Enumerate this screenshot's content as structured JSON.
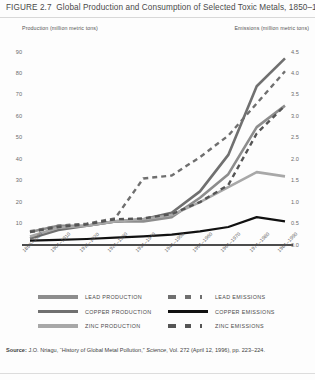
{
  "figure": {
    "number": "FIGURE 2.7",
    "title": "Global Production and Consumption of Selected Toxic Metals, 1850–1990"
  },
  "axis_captions": {
    "left": "Production (million metric tons)",
    "right": "Emissions (million metric tons)"
  },
  "source": {
    "label": "Source:",
    "text": " J.O. Nriagu, “History of Global Metal Pollution,” ",
    "italic": "Science",
    "text2": ", Vol. 272 (April 12, 1996), pp. 223–224."
  },
  "colors": {
    "lead": "#8d8d8d",
    "copper": "#707070",
    "zinc": "#a8a8a8",
    "lead_emissions": "#6f6f6f",
    "copper_emissions": "#111111",
    "zinc_emissions": "#555555",
    "axis": "#111111",
    "tick_text": "#6b6b6b",
    "title_text": "#4a4a4a"
  },
  "legend": [
    {
      "key": "lead-production",
      "label": "LEAD PRODUCTION",
      "style": "solid",
      "color": "#8d8d8d",
      "column": "left"
    },
    {
      "key": "copper-production",
      "label": "COPPER PRODUCTION",
      "style": "solid",
      "color": "#707070",
      "column": "left"
    },
    {
      "key": "zinc-production",
      "label": "ZINC PRODUCTION",
      "style": "solid",
      "color": "#a8a8a8",
      "column": "left"
    },
    {
      "key": "lead-emissions",
      "label": "LEAD EMISSIONS",
      "style": "dashed",
      "color": "#6f6f6f",
      "column": "right"
    },
    {
      "key": "copper-emissions",
      "label": "COPPER EMISSIONS",
      "style": "solid",
      "color": "#111111",
      "column": "right"
    },
    {
      "key": "zinc-emissions",
      "label": "ZINC EMISSIONS",
      "style": "dashed",
      "color": "#555555",
      "column": "right"
    }
  ],
  "chart_data": {
    "type": "line",
    "title": "Global Production and Consumption of Selected Toxic Metals, 1850–1990",
    "xlabel": "",
    "ylabel": "Production (million metric tons)",
    "y2label": "Emissions (million metric tons)",
    "grid": false,
    "legend_position": "bottom",
    "categories": [
      "1850–1900",
      "1901–1910",
      "1911–1920",
      "1921–1930",
      "1931–1940",
      "1941–1950",
      "1951–1960",
      "1961–1970",
      "1971–1980",
      "1981–1990"
    ],
    "ylim": [
      0,
      90
    ],
    "yticks": [
      10,
      20,
      30,
      40,
      50,
      60,
      70,
      80,
      90
    ],
    "y2lim": [
      0,
      4.5
    ],
    "y2ticks": [
      0.0,
      0.5,
      1.0,
      1.5,
      2.0,
      2.5,
      3.0,
      3.5,
      4.0,
      4.5
    ],
    "series": [
      {
        "name": "LEAD PRODUCTION",
        "axis": "left",
        "style": "solid",
        "color": "#8d8d8d",
        "values": [
          6,
          9,
          9,
          11,
          11,
          13,
          22,
          33,
          55,
          65
        ]
      },
      {
        "name": "COPPER PRODUCTION",
        "axis": "left",
        "style": "solid",
        "color": "#707070",
        "values": [
          3,
          7,
          9,
          11,
          12,
          15,
          25,
          42,
          74,
          87
        ]
      },
      {
        "name": "ZINC PRODUCTION",
        "axis": "left",
        "style": "solid",
        "color": "#a8a8a8",
        "values": [
          4,
          8,
          9,
          11,
          12,
          14,
          20,
          27,
          34,
          32
        ]
      },
      {
        "name": "LEAD EMISSIONS",
        "axis": "right",
        "style": "dashed",
        "color": "#6f6f6f",
        "values": [
          0.32,
          0.45,
          0.5,
          0.62,
          1.55,
          1.62,
          2.05,
          2.55,
          3.3,
          4.05
        ]
      },
      {
        "name": "COPPER EMISSIONS",
        "axis": "right",
        "style": "solid",
        "color": "#111111",
        "values": [
          0.1,
          0.12,
          0.14,
          0.17,
          0.2,
          0.24,
          0.32,
          0.42,
          0.65,
          0.55
        ]
      },
      {
        "name": "ZINC EMISSIONS",
        "axis": "right",
        "style": "dashed",
        "color": "#555555",
        "values": [
          0.3,
          0.42,
          0.48,
          0.6,
          0.62,
          0.72,
          1.0,
          1.4,
          2.6,
          3.25
        ]
      }
    ]
  }
}
